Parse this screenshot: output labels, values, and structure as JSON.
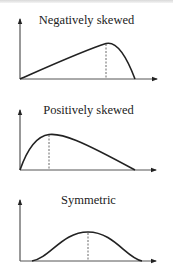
{
  "diagrams": [
    {
      "title": "Negatively skewed",
      "shape": "left-tailed curve, mode to the right"
    },
    {
      "title": "Positively skewed",
      "shape": "right-tailed curve, mode to the left"
    },
    {
      "title": "Symmetric",
      "shape": "bell curve, mode in center"
    }
  ],
  "colors": {
    "line": "#222222",
    "background": "#ffffff"
  }
}
